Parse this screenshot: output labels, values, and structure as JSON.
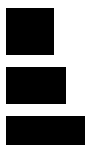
{
  "background": "#ffffff",
  "blocks": [
    {
      "name": "block-1",
      "color": "#000000",
      "x": 6,
      "y": 8,
      "w": 48,
      "h": 47
    },
    {
      "name": "block-2",
      "color": "#000000",
      "x": 6,
      "y": 67,
      "w": 60,
      "h": 37
    },
    {
      "name": "block-3",
      "color": "#000000",
      "x": 6,
      "y": 116,
      "w": 79,
      "h": 29
    }
  ]
}
